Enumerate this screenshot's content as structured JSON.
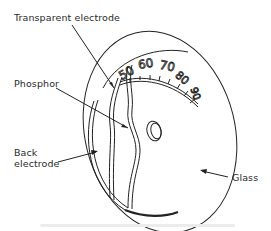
{
  "diagram": {
    "labels": {
      "transparent_electrode": "Transparent electrode",
      "phosphor": "Phosphor",
      "back_electrode_line1": "Back",
      "back_electrode_line2": "electrode",
      "glass": "Glass"
    },
    "dial_scale": [
      "50",
      "60",
      "70",
      "80",
      "90"
    ],
    "colors": {
      "line": "#222222",
      "background": "#ffffff"
    }
  }
}
